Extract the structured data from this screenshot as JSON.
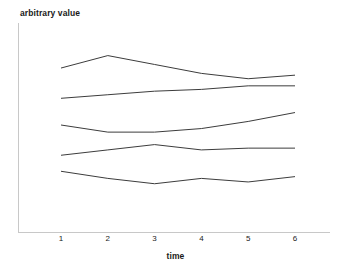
{
  "chart_data": {
    "type": "line",
    "title": "",
    "subtitle": "",
    "xlabel": "time",
    "ylabel": "arbitrary value",
    "x": [
      1,
      2,
      3,
      4,
      5,
      6
    ],
    "xtick_labels": [
      "1",
      "2",
      "3",
      "4",
      "5",
      "6"
    ],
    "ytick_labels": [],
    "xlim": [
      0.55,
      6.95
    ],
    "ylim": [
      0,
      100
    ],
    "grid": false,
    "legend": null,
    "legend_position": "none",
    "annotations": [],
    "line_color": "#3c3c3c",
    "axis_color": "#c8c8c8",
    "background_color": "#ffffff",
    "series": [
      {
        "name": "series-1",
        "values": [
          82,
          89,
          84,
          79,
          76,
          78
        ],
        "color": "#3c3c3c"
      },
      {
        "name": "series-2",
        "values": [
          65,
          67,
          69,
          70,
          72,
          72
        ],
        "color": "#3c3c3c"
      },
      {
        "name": "series-3",
        "values": [
          50,
          46,
          46,
          48,
          52,
          57
        ],
        "color": "#3c3c3c"
      },
      {
        "name": "series-4",
        "values": [
          33,
          36,
          39,
          36,
          37,
          37
        ],
        "color": "#3c3c3c"
      },
      {
        "name": "series-5",
        "values": [
          24,
          20,
          17,
          20,
          18,
          21
        ],
        "color": "#3c3c3c"
      }
    ]
  },
  "axes": {
    "y_axis_label": "arbitrary value",
    "x_axis_label": "time"
  },
  "ticks": {
    "x": [
      "1",
      "2",
      "3",
      "4",
      "5",
      "6"
    ]
  }
}
